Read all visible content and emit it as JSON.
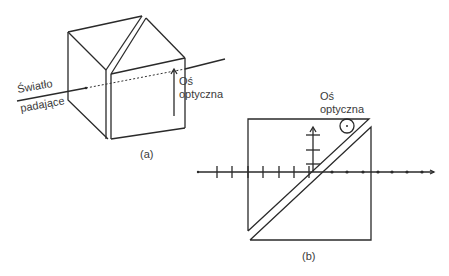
{
  "figure_a": {
    "caption": "(a)",
    "incident_label_line1": "Światło",
    "incident_label_line2": "padające",
    "axis_label_line1": "Oś",
    "axis_label_line2": "optyczna"
  },
  "figure_b": {
    "caption": "(b)",
    "axis_label_line1": "Oś",
    "axis_label_line2": "optyczna"
  },
  "colors": {
    "line": "#2a2a2a",
    "text": "#3a3a3a",
    "background": "#ffffff"
  }
}
